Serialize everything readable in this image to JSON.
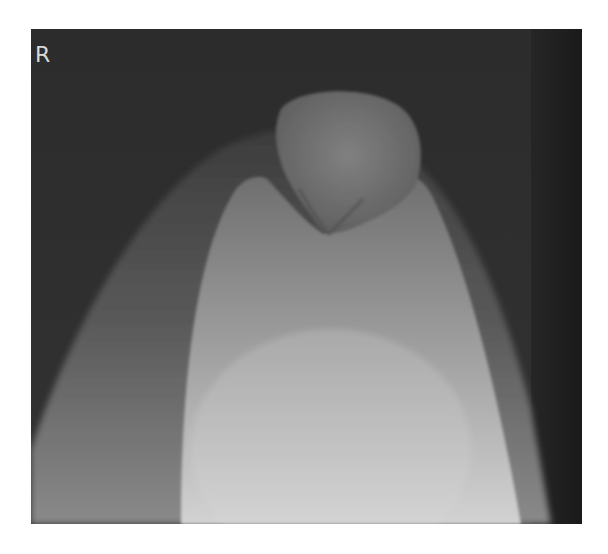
{
  "image": {
    "type": "radiograph",
    "view": "knee skyline (patellar) view",
    "side_marker": "R",
    "colors": {
      "page_background": "#ffffff",
      "film_background": "#2a2a2a",
      "soft_tissue": "#5a5a5a",
      "femur_bright": "#d0d0d0",
      "patella": "#7a7a7a",
      "right_edge_band": "#1c1c1c",
      "marker_text": "#d8d8d8"
    }
  }
}
